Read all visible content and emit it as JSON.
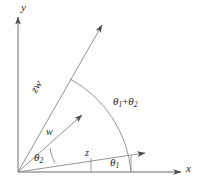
{
  "figure": {
    "kind": "complex-multiplication-argand-diagram",
    "background_color": "#fdfdfc",
    "stroke_color": "#6e6e6e",
    "text_color": "#262626",
    "axes": {
      "x_label": "x",
      "y_label": "y",
      "origin": {
        "x": 18,
        "y": 172
      }
    },
    "vectors": [
      {
        "name": "z",
        "label": "z",
        "angle_label": "θ",
        "angle_subscript": "1",
        "tip": {
          "x": 148,
          "y": 152
        }
      },
      {
        "name": "w",
        "label": "w",
        "angle_label": "θ",
        "angle_subscript": "2",
        "tip": {
          "x": 85,
          "y": 112
        }
      },
      {
        "name": "zw",
        "label": "zw",
        "tip": {
          "x": 105,
          "y": 22
        }
      }
    ],
    "angles": {
      "theta1": {
        "symbol": "θ",
        "subscript": "1"
      },
      "theta2": {
        "symbol": "θ",
        "subscript": "2"
      },
      "sum": {
        "symbol": "θ",
        "sub_a": "1",
        "operator": "+",
        "sub_b": "2"
      }
    }
  }
}
